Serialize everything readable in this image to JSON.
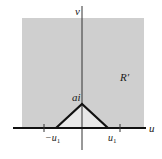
{
  "diagram": {
    "axes": {
      "horizontal_label": "u",
      "vertical_label": "v"
    },
    "region_label": "R′",
    "apex_label": "ai",
    "tick_labels": {
      "left": "−u",
      "left_sub": "1",
      "right": "u",
      "right_sub": "1"
    },
    "colors": {
      "region_fill": "#cfcfcf",
      "triangle_fill": "#e8e8e8",
      "lines": "#111111",
      "background": "#ffffff"
    }
  }
}
